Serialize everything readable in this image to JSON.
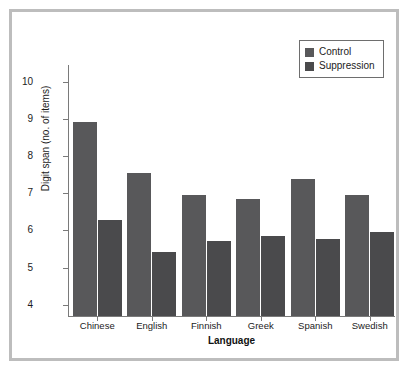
{
  "chart_data": {
    "type": "bar",
    "title": "",
    "subtitle": "",
    "xlabel": "Language",
    "ylabel": "Digit span (no. of items)",
    "categories": [
      "Chinese",
      "English",
      "Finnish",
      "Greek",
      "Spanish",
      "Swedish"
    ],
    "series": [
      {
        "name": "Control",
        "color": "#58585a",
        "values": [
          8.92,
          7.55,
          6.95,
          6.85,
          7.38,
          6.95
        ]
      },
      {
        "name": "Suppression",
        "color": "#4a4a4c",
        "values": [
          6.28,
          5.42,
          5.72,
          5.85,
          5.78,
          5.95
        ]
      }
    ],
    "ylim": [
      3.7,
      10.45
    ],
    "yticks": [
      4,
      5,
      6,
      7,
      8,
      9,
      10
    ],
    "ytick_labels": [
      "4",
      "5",
      "6",
      "7",
      "8",
      "9",
      "10"
    ],
    "grid": false,
    "legend": {
      "position": "top-right",
      "entries": [
        "Control",
        "Suppression"
      ]
    }
  },
  "figure": {
    "frame_color": "#bdbdbd",
    "background": "#ffffff",
    "axis_color": "#7a7a7a"
  }
}
